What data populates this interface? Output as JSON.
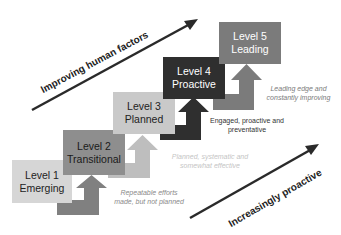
{
  "diagram": {
    "type": "maturity-staircase",
    "levels": [
      {
        "id": 1,
        "title": "Level 1",
        "name": "Emerging",
        "color": "#d6d6d6",
        "text_color": "#222222"
      },
      {
        "id": 2,
        "title": "Level 2",
        "name": "Transitional",
        "color": "#8e8e8e",
        "text_color": "#1a1a1a"
      },
      {
        "id": 3,
        "title": "Level 3",
        "name": "Planned",
        "color": "#c9c9c9",
        "text_color": "#222222"
      },
      {
        "id": 4,
        "title": "Level 4",
        "name": "Proactive",
        "color": "#2f2f2f",
        "text_color": "#ffffff"
      },
      {
        "id": 5,
        "title": "Level 5",
        "name": "Leading",
        "color": "#7b7b7b",
        "text_color": "#ffffff"
      }
    ],
    "arrows": [
      {
        "from": 1,
        "to": 2,
        "color": "#808080"
      },
      {
        "from": 2,
        "to": 3,
        "color": "#bebebe"
      },
      {
        "from": 3,
        "to": 4,
        "color": "#2f2f2f"
      },
      {
        "from": 4,
        "to": 5,
        "color": "#7b7b7b"
      }
    ],
    "descriptions": [
      {
        "level": 2,
        "line1": "Repeatable efforts",
        "line2": "made, but not planned",
        "color": "#8a8a8a",
        "italic": true
      },
      {
        "level": 3,
        "line1": "Planned, systematic and",
        "line2": "somewhat effective",
        "color": "#c4c4c4",
        "italic": true
      },
      {
        "level": 4,
        "line1": "Engaged, proactive and",
        "line2": "preventative",
        "color": "#333333",
        "italic": false
      },
      {
        "level": 5,
        "line1": "Leading edge and",
        "line2": "constantly improving",
        "color": "#7b7b7b",
        "italic": true
      }
    ],
    "axes": {
      "top": {
        "label": "Improving human factors",
        "color": "#2a2a2a"
      },
      "bottom": {
        "label": "Increasingly proactive",
        "color": "#2a2a2a"
      }
    }
  }
}
